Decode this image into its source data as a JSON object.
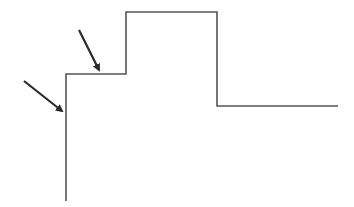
{
  "diagram": {
    "type": "step-profile-with-arrows",
    "canvas": {
      "width": 354,
      "height": 207
    },
    "colors": {
      "background": "#ffffff",
      "line": "#555555",
      "arrow": "#2a2a2a"
    },
    "profile_points": [
      [
        66,
        201
      ],
      [
        66,
        74
      ],
      [
        126,
        74
      ],
      [
        126,
        12
      ],
      [
        217,
        12
      ],
      [
        217,
        106
      ],
      [
        338,
        106
      ]
    ],
    "arrows": [
      {
        "name": "arrow-to-vertical-edge",
        "from": [
          24,
          81
        ],
        "to": [
          62,
          111
        ]
      },
      {
        "name": "arrow-to-step-corner",
        "from": [
          79,
          30
        ],
        "to": [
          99,
          70
        ]
      }
    ]
  }
}
